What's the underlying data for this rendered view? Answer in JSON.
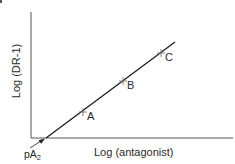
{
  "diagram": {
    "type": "schild-plot",
    "x_axis_label": "Log (antagonist)",
    "y_axis_label": "Log (DR-1)",
    "intercept_label_main": "pA",
    "intercept_label_sub": "2",
    "points": [
      {
        "label": "A"
      },
      {
        "label": "B"
      },
      {
        "label": "C"
      }
    ],
    "colors": {
      "axis": "#555555",
      "line": "#1a1a1a",
      "marker": "#777777",
      "text": "#2a2a2a"
    }
  }
}
